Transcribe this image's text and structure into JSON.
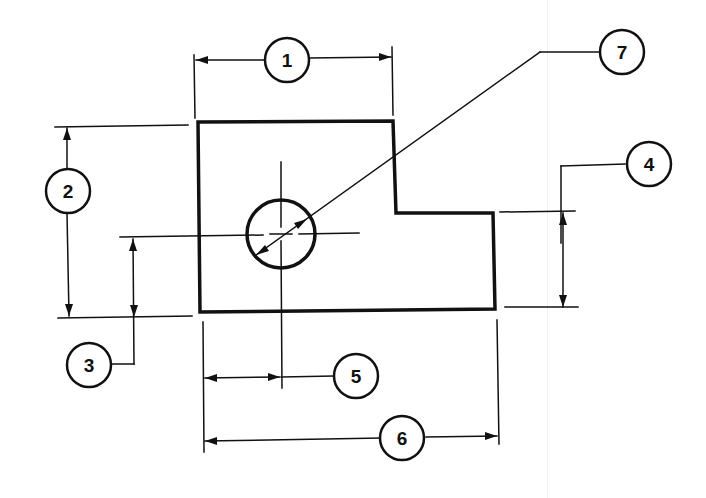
{
  "drawing": {
    "title": "L-shaped part with hole — dimension callouts",
    "stroke_color": "#111111",
    "background": "#ffffff",
    "callouts": [
      {
        "id": "1",
        "label": "1",
        "meaning": "overall width of upper portion"
      },
      {
        "id": "2",
        "label": "2",
        "meaning": "overall height"
      },
      {
        "id": "3",
        "label": "3",
        "meaning": "hole center height from bottom"
      },
      {
        "id": "4",
        "label": "4",
        "meaning": "height of right step"
      },
      {
        "id": "5",
        "label": "5",
        "meaning": "hole center distance from left edge"
      },
      {
        "id": "6",
        "label": "6",
        "meaning": "overall length"
      },
      {
        "id": "7",
        "label": "7",
        "meaning": "hole diameter"
      }
    ]
  }
}
